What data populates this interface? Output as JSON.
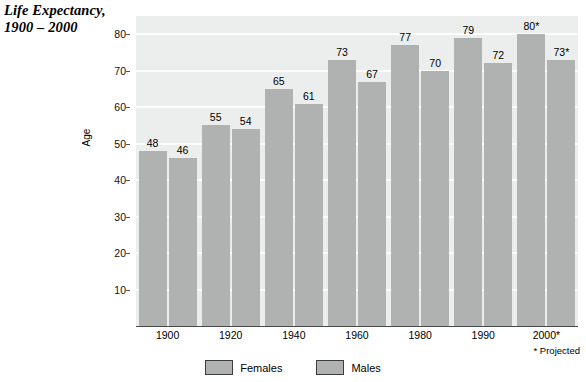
{
  "title": {
    "line1": "Life Expectancy,",
    "line2": "1900 – 2000"
  },
  "footnote": "* Projected",
  "legend": {
    "position": "bottom-center",
    "entries": [
      {
        "label": "Females",
        "color": "#b0b2b2"
      },
      {
        "label": "Males",
        "color": "#b0b2b2"
      }
    ]
  },
  "axes": {
    "ylabel": "Age",
    "yticks": [
      10,
      20,
      30,
      40,
      50,
      60,
      70,
      80
    ],
    "ylim": [
      0,
      85
    ],
    "xlabel": "",
    "xticks": [
      "1900",
      "1920",
      "1940",
      "1960",
      "1980",
      "1990",
      "2000*"
    ]
  },
  "colors": {
    "bar": "#b0b2b2",
    "plot_background": "#eceeee",
    "gridline": "#fbfcfc",
    "axis": "#4a4a4a",
    "text": "#000000"
  },
  "chart_data": {
    "type": "bar",
    "title": "Life Expectancy, 1900 – 2000",
    "xlabel": "",
    "ylabel": "Age",
    "ylim": [
      0,
      85
    ],
    "yticks": [
      10,
      20,
      30,
      40,
      50,
      60,
      70,
      80
    ],
    "grid": true,
    "legend_position": "bottom-center",
    "categories": [
      "1900",
      "1920",
      "1940",
      "1960",
      "1980",
      "1990",
      "2000*"
    ],
    "series": [
      {
        "name": "Females",
        "color": "#b0b2b2",
        "values": [
          48,
          55,
          65,
          73,
          77,
          79,
          80
        ],
        "labels": [
          "48",
          "55",
          "65",
          "73",
          "77",
          "79",
          "80*"
        ]
      },
      {
        "name": "Males",
        "color": "#b0b2b2",
        "values": [
          46,
          54,
          61,
          67,
          70,
          72,
          73
        ],
        "labels": [
          "46",
          "54",
          "61",
          "67",
          "70",
          "72",
          "73*"
        ]
      }
    ],
    "annotations": [
      "* Projected"
    ]
  }
}
